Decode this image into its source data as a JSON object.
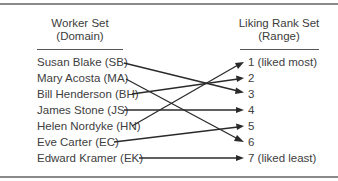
{
  "domain_heading": {
    "line1": "Worker Set",
    "line2": "(Domain)"
  },
  "range_heading": {
    "line1": "Liking Rank Set",
    "line2": "(Range)"
  },
  "domain": [
    {
      "label": "Susan Blake (SB)",
      "maps_to": 3
    },
    {
      "label": "Mary Acosta (MA)",
      "maps_to": 6
    },
    {
      "label": "Bill Henderson (BH)",
      "maps_to": 2
    },
    {
      "label": "James Stone (JS)",
      "maps_to": 4
    },
    {
      "label": "Helen Nordyke (HN)",
      "maps_to": 1
    },
    {
      "label": "Eve Carter (EC)",
      "maps_to": 5
    },
    {
      "label": "Edward Kramer (EK)",
      "maps_to": 7
    }
  ],
  "range": [
    {
      "rank": 1,
      "label": "1 (liked most)"
    },
    {
      "rank": 2,
      "label": "2"
    },
    {
      "rank": 3,
      "label": "3"
    },
    {
      "rank": 4,
      "label": "4"
    },
    {
      "rank": 5,
      "label": "5"
    },
    {
      "rank": 6,
      "label": "6"
    },
    {
      "rank": 7,
      "label": "7 (liked least)"
    }
  ],
  "colors": {
    "frame": "#8a8a8a",
    "text": "#404040",
    "arrow": "#2a2a2a"
  }
}
